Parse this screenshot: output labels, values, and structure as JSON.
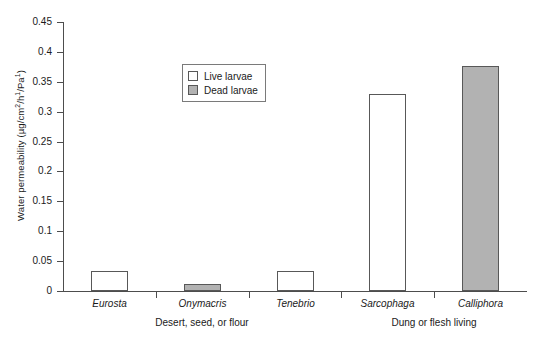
{
  "chart_data": {
    "type": "bar",
    "title": "",
    "xlabel": "",
    "ylabel": "Water permeability (µg/cm2/h1/Pa1)",
    "ylabel_parts": {
      "prefix": "Water permeability (µg/cm",
      "sup1": "2",
      "mid1": "/h",
      "sup2": "1",
      "mid2": "/Pa",
      "sup3": "1",
      "suffix": ")"
    },
    "categories": [
      "Eurosta",
      "Onymacris",
      "Tenebrio",
      "Sarcophaga",
      "Calliphora"
    ],
    "values": [
      0.033,
      0.011,
      0.033,
      0.329,
      0.376
    ],
    "bar_states": [
      "Live larvae",
      "Dead larvae",
      "Live larvae",
      "Live larvae",
      "Dead larvae"
    ],
    "ylim": [
      0,
      0.45
    ],
    "ytick_labels": [
      "0",
      "0.05",
      "0.1",
      "0.15",
      "0.2",
      "0.25",
      "0.3",
      "0.35",
      "0.4",
      "0.45"
    ],
    "ytick_values": [
      0,
      0.05,
      0.1,
      0.15,
      0.2,
      0.25,
      0.3,
      0.35,
      0.4,
      0.45
    ],
    "grid": false,
    "legend_position": "upper center",
    "legend": [
      {
        "label": "Live larvae",
        "swatch": "white",
        "color": "#ffffff"
      },
      {
        "label": "Dead larvae",
        "swatch": "gray",
        "color": "#b2b2b2"
      }
    ],
    "group_labels": [
      {
        "text": "Desert, seed, or flour",
        "center_pct": 30
      },
      {
        "text": "Dung or flesh living",
        "center_pct": 80
      }
    ]
  },
  "colors": {
    "live_fill": "#ffffff",
    "dead_fill": "#b2b2b2",
    "bar_stroke": "#585858",
    "axis": "#4d4d4d",
    "text": "#1a1a1a",
    "background": "#ffffff"
  }
}
